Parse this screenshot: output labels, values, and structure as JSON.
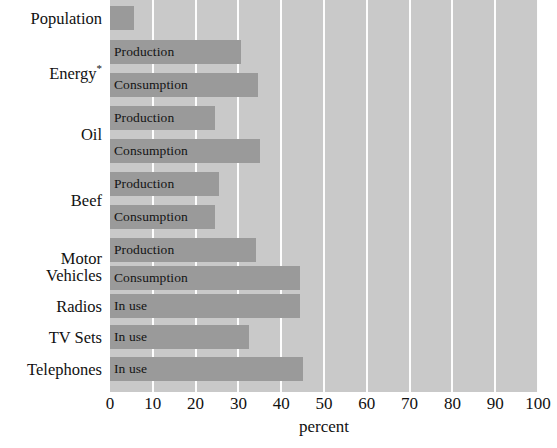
{
  "chart_data": {
    "type": "bar",
    "orientation": "horizontal",
    "title": "",
    "xlabel": "percent",
    "ylabel": "",
    "xlim": [
      0,
      100
    ],
    "xticks": [
      0,
      10,
      20,
      30,
      40,
      50,
      60,
      70,
      80,
      90,
      100
    ],
    "xtick_labels": [
      "0",
      "10",
      "20",
      "30",
      "40",
      "50",
      "60",
      "70",
      "80",
      "90",
      "100"
    ],
    "grid": true,
    "grid_axis": "x",
    "legend": "none",
    "categories": [
      "Population",
      "Energy*",
      "Oil",
      "Beef",
      "Motor Vehicles",
      "Radios",
      "TV Sets",
      "Telephones"
    ],
    "bars": [
      {
        "category": "Population",
        "series": "",
        "in_bar_label": "",
        "value": 5.6
      },
      {
        "category": "Energy*",
        "series": "Production",
        "in_bar_label": "Production",
        "value": 30.5
      },
      {
        "category": "Energy*",
        "series": "Consumption",
        "in_bar_label": "Consumption",
        "value": 34.5
      },
      {
        "category": "Oil",
        "series": "Production",
        "in_bar_label": "Production",
        "value": 24.5
      },
      {
        "category": "Oil",
        "series": "Consumption",
        "in_bar_label": "Consumption",
        "value": 35.0
      },
      {
        "category": "Beef",
        "series": "Production",
        "in_bar_label": "Production",
        "value": 25.5
      },
      {
        "category": "Beef",
        "series": "Consumption",
        "in_bar_label": "Consumption",
        "value": 24.5
      },
      {
        "category": "Motor Vehicles",
        "series": "Production",
        "in_bar_label": "Production",
        "value": 34.0
      },
      {
        "category": "Motor Vehicles",
        "series": "Consumption",
        "in_bar_label": "Consumption",
        "value": 44.5
      },
      {
        "category": "Radios",
        "series": "In use",
        "in_bar_label": "In use",
        "value": 44.5
      },
      {
        "category": "TV Sets",
        "series": "In use",
        "in_bar_label": "In use",
        "value": 32.5
      },
      {
        "category": "Telephones",
        "series": "In use",
        "in_bar_label": "In use",
        "value": 45.0
      }
    ],
    "colors": {
      "bar": "#9a9a9a",
      "plot_background": "#c9c9c9",
      "gridline": "#fdfdfd",
      "text": "#111111",
      "page_background": "#ffffff"
    }
  },
  "axis": {
    "x_title": "percent"
  },
  "category_labels": [
    {
      "text": "Population",
      "superscript": ""
    },
    {
      "text": "Energy",
      "superscript": "*"
    },
    {
      "text": "Oil",
      "superscript": ""
    },
    {
      "text": "Beef",
      "superscript": ""
    },
    {
      "text": "Motor Vehicles",
      "superscript": ""
    },
    {
      "text": "Radios",
      "superscript": ""
    },
    {
      "text": "TV Sets",
      "superscript": ""
    },
    {
      "text": "Telephones",
      "superscript": ""
    }
  ]
}
